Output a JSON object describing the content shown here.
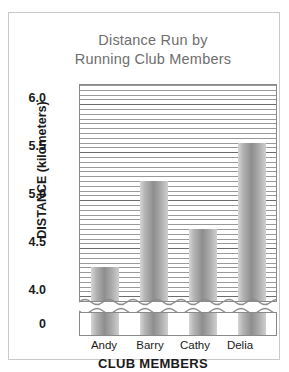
{
  "chart_data": {
    "type": "bar",
    "title": "Distance Run by Running Club Members",
    "title_line1": "Distance Run by",
    "title_line2": "Running Club Members",
    "xlabel": "CLUB MEMBERS",
    "ylabel": "DISTANCE (kilometers)",
    "categories": [
      "Andy",
      "Barry",
      "Cathy",
      "Delia"
    ],
    "values": [
      4.3,
      5.2,
      4.7,
      5.6
    ],
    "ylim": [
      3.95,
      6.2
    ],
    "y_tick_labels": [
      "0",
      "4.0",
      "4.5",
      "5.0",
      "5.5",
      "6.0"
    ],
    "y_major_ticks": [
      4.0,
      4.5,
      5.0,
      5.5,
      6.0
    ],
    "y_gridline_step": 0.05,
    "axis_break": true,
    "axis_break_zero_label": "0",
    "grid": true,
    "legend": "none",
    "bar_color": "#9a9a9a",
    "frame_color": "#8a8a8a",
    "title_color": "#6e6e6e",
    "text_color": "#1b1b1b"
  }
}
